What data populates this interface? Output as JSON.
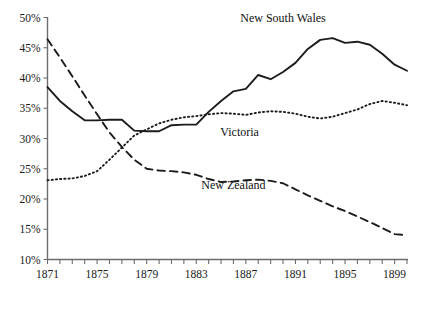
{
  "chart_data": {
    "type": "line",
    "title": "",
    "subtitle": "",
    "xlabel": "",
    "ylabel": "",
    "xlim": [
      1871,
      1900
    ],
    "ylim": [
      10,
      50
    ],
    "grid": false,
    "legend_position": "inline-annotations",
    "y_tick_labels": [
      "50%",
      "45%",
      "40%",
      "35%",
      "30%",
      "25%",
      "20%",
      "15%",
      "10%"
    ],
    "y_tick_values": [
      50,
      45,
      40,
      35,
      30,
      25,
      20,
      15,
      10
    ],
    "x_tick_labels": [
      "1871",
      "1875",
      "1879",
      "1883",
      "1887",
      "1891",
      "1895",
      "1899"
    ],
    "x_tick_values": [
      1871,
      1875,
      1879,
      1883,
      1887,
      1891,
      1895,
      1899
    ],
    "x_minor_ticks": [
      1871,
      1872,
      1873,
      1874,
      1875,
      1876,
      1877,
      1878,
      1879,
      1880,
      1881,
      1882,
      1883,
      1884,
      1885,
      1886,
      1887,
      1888,
      1889,
      1890,
      1891,
      1892,
      1893,
      1894,
      1895,
      1896,
      1897,
      1898,
      1899,
      1900
    ],
    "x": [
      1871,
      1872,
      1873,
      1874,
      1875,
      1876,
      1877,
      1878,
      1879,
      1880,
      1881,
      1882,
      1883,
      1884,
      1885,
      1886,
      1887,
      1888,
      1889,
      1890,
      1891,
      1892,
      1893,
      1894,
      1895,
      1896,
      1897,
      1898,
      1899,
      1900
    ],
    "series": [
      {
        "name": "New South Wales",
        "style": "solid",
        "color": "#1c1c1c",
        "label_x": 1890.0,
        "label_y": 49.2,
        "values": [
          38.5,
          36.2,
          34.5,
          33.0,
          33.0,
          33.1,
          33.1,
          31.3,
          31.2,
          31.2,
          32.2,
          32.3,
          32.3,
          34.4,
          36.2,
          37.8,
          38.2,
          40.5,
          39.8,
          41.0,
          42.5,
          44.8,
          46.3,
          46.6,
          45.8,
          46.0,
          45.5,
          44.0,
          42.2,
          41.2
        ]
      },
      {
        "name": "Victoria",
        "style": "dotted",
        "color": "#1c1c1c",
        "label_x": 1886.5,
        "label_y": 30.4,
        "values": [
          23.1,
          23.3,
          23.4,
          23.8,
          24.6,
          26.5,
          28.5,
          30.5,
          31.5,
          32.5,
          33.1,
          33.5,
          33.7,
          34.0,
          34.2,
          34.1,
          33.9,
          34.3,
          34.5,
          34.4,
          34.1,
          33.6,
          33.3,
          33.6,
          34.2,
          34.8,
          35.7,
          36.2,
          35.9,
          35.5
        ]
      },
      {
        "name": "New Zealand",
        "style": "dashed",
        "color": "#1c1c1c",
        "label_x": 1886.0,
        "label_y": 21.6,
        "values": [
          46.4,
          43.4,
          40.3,
          37.1,
          34.0,
          31.0,
          28.6,
          26.5,
          25.0,
          24.7,
          24.6,
          24.4,
          24.0,
          23.3,
          22.8,
          22.9,
          23.1,
          23.2,
          23.0,
          22.6,
          21.6,
          20.6,
          19.7,
          18.8,
          18.0,
          17.1,
          16.2,
          15.2,
          14.2,
          14.0
        ]
      }
    ]
  },
  "axes": {
    "y_axis_name": "percentage-axis",
    "x_axis_name": "year-axis"
  }
}
